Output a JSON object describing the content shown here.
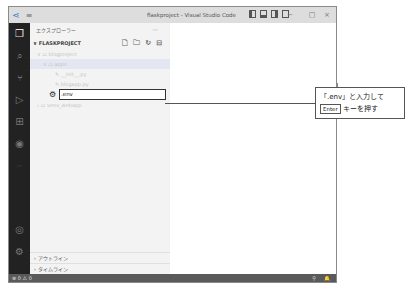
{
  "window": {
    "title": "flaskproject - Visual Studio Code",
    "menu_icon": "hamburger-icon",
    "logo_icon": "vscode-logo-icon",
    "controls": {
      "minimize": "−",
      "maximize": "□",
      "close": "×"
    }
  },
  "activity_bar": {
    "items": [
      {
        "name": "explorer",
        "glyph": "❐",
        "active": true
      },
      {
        "name": "search",
        "glyph": "⌕"
      },
      {
        "name": "source-control",
        "glyph": "⑂"
      },
      {
        "name": "run-debug",
        "glyph": "▷"
      },
      {
        "name": "extensions",
        "glyph": "⊞"
      },
      {
        "name": "remote",
        "glyph": "◉"
      },
      {
        "name": "more",
        "glyph": "···"
      },
      {
        "name": "account",
        "glyph": "◎"
      },
      {
        "name": "settings",
        "glyph": "⚙"
      }
    ]
  },
  "sidebar": {
    "header": "エクスプローラー",
    "more": "···",
    "section": "FLASKPROJECT",
    "section_chevron": "∨",
    "actions": [
      "🗋",
      "🗀",
      "↻",
      "⊟"
    ],
    "tree": [
      {
        "label": "blogproject",
        "prefix": "∨ ▭",
        "indent": 7
      },
      {
        "label": "apps",
        "prefix": "∨ ▭",
        "indent": 13,
        "selected": true
      },
      {
        "label": "__init__.py",
        "prefix": "✎",
        "indent": 25
      },
      {
        "label": "blogapp.py",
        "prefix": "✎",
        "indent": 25
      }
    ],
    "new_file_input": {
      "value": ".env",
      "icon": "⚙"
    },
    "tree_after": [
      {
        "label": "venv_webapp",
        "prefix": "› ▭",
        "indent": 7
      }
    ],
    "bottom": [
      {
        "label": "アウトライン",
        "chevron": "›"
      },
      {
        "label": "タイムライン",
        "chevron": "›"
      }
    ]
  },
  "statusbar": {
    "errors": "⊗ 0",
    "warnings": "⚠ 0",
    "right_icons": [
      "⚲",
      "🔔"
    ]
  },
  "callout": {
    "line1": "「.env」と入力して",
    "key": "Enter",
    "line2_suffix": "キーを押す"
  }
}
